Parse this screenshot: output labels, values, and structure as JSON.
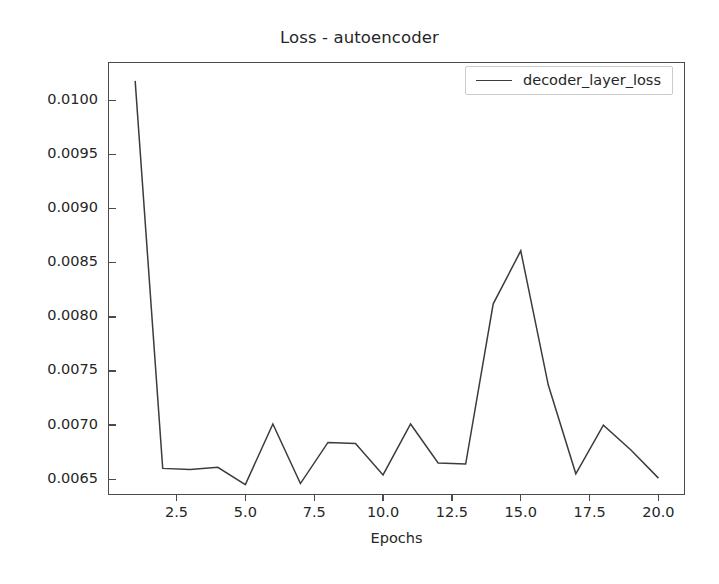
{
  "chart_data": {
    "type": "line",
    "title": "Loss - autoencoder",
    "xlabel": "Epochs",
    "ylabel": "",
    "legend_position": "upper right",
    "grid": false,
    "xlim": [
      0.05,
      21.0
    ],
    "ylim": [
      0.006345,
      0.010345
    ],
    "xticks": [
      2.5,
      5.0,
      7.5,
      10.0,
      12.5,
      15.0,
      17.5,
      20.0
    ],
    "xtick_labels": [
      "2.5",
      "5.0",
      "7.5",
      "10.0",
      "12.5",
      "15.0",
      "17.5",
      "20.0"
    ],
    "yticks": [
      0.0065,
      0.007,
      0.0075,
      0.008,
      0.0085,
      0.009,
      0.0095,
      0.01
    ],
    "ytick_labels": [
      "0.0065",
      "0.0070",
      "0.0075",
      "0.0080",
      "0.0085",
      "0.0090",
      "0.0095",
      "0.0100"
    ],
    "x": [
      1,
      2,
      3,
      4,
      5,
      6,
      7,
      8,
      9,
      10,
      11,
      12,
      13,
      14,
      15,
      16,
      17,
      18,
      19,
      20
    ],
    "series": [
      {
        "name": "decoder_layer_loss",
        "color": "#3c3c3c",
        "linewidth": 1.5,
        "values": [
          0.01018,
          0.0066,
          0.00659,
          0.00661,
          0.00645,
          0.00701,
          0.00646,
          0.00684,
          0.00683,
          0.00654,
          0.00701,
          0.00665,
          0.00664,
          0.00812,
          0.00861,
          0.00737,
          0.00655,
          0.007,
          0.00677,
          0.00651
        ]
      }
    ]
  },
  "legend": {
    "entries": [
      {
        "label": "decoder_layer_loss",
        "color": "#3c3c3c"
      }
    ]
  },
  "figure": {
    "background": "#ffffff",
    "axes_color": "#4a4a4a",
    "text_color": "#262626"
  }
}
